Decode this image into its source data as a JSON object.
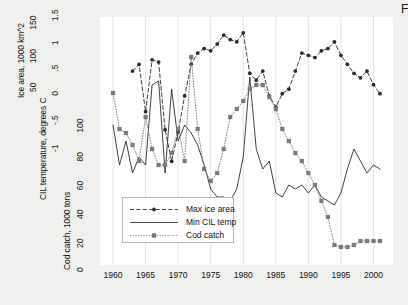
{
  "corner_mark": "F",
  "colors": {
    "page_background": "#f0f0ee",
    "plot_background": "#ffffff",
    "gridline": "#e3e3e3",
    "ice_series": "#2b2b2b",
    "temp_series": "#2b2b2b",
    "cod_series": "#7a7a7a",
    "text": "#111111"
  },
  "axes": {
    "ice": {
      "title": "Ice area, 1000 km^2",
      "ticks": [
        "50",
        "100",
        "150",
        "200"
      ],
      "values": [
        50,
        100,
        150,
        200
      ]
    },
    "cil": {
      "title": "CIL temperature, degrees C",
      "ticks": [
        "-1",
        "-.5",
        "0",
        ".5",
        "1",
        "1.5"
      ],
      "values": [
        -1,
        -0.5,
        0,
        0.5,
        1,
        1.5
      ]
    },
    "cod": {
      "title": "Cod catch, 1000 tons",
      "ticks": [
        "0",
        "20",
        "40",
        "60",
        "80",
        "100"
      ],
      "values": [
        0,
        20,
        40,
        60,
        80,
        100
      ]
    },
    "x": {
      "ticks": [
        "1960",
        "1965",
        "1970",
        "1975",
        "1980",
        "1985",
        "1990",
        "1995",
        "2000"
      ],
      "values": [
        1960,
        1965,
        1970,
        1975,
        1980,
        1985,
        1990,
        1995,
        2000
      ]
    }
  },
  "legend": {
    "items": [
      {
        "label": "Max ice area",
        "style": "dashed-marker",
        "marker": "circle"
      },
      {
        "label": "Min CIL temp",
        "style": "solid",
        "marker": "none"
      },
      {
        "label": "Cod catch",
        "style": "dotted-marker",
        "marker": "square"
      }
    ]
  },
  "chart_data": {
    "type": "line",
    "title": "",
    "xlabel": "",
    "ylabel": "",
    "grid": "vertical",
    "legend_position": "inside-bottom-left",
    "xlim": [
      1958,
      2003
    ],
    "series": [
      {
        "name": "Max ice area",
        "units": "1000 km^2",
        "axis": "ice",
        "ylim": [
          0,
          220
        ],
        "style": "dashed",
        "marker": "circle",
        "x": [
          1963,
          1964,
          1965,
          1966,
          1967,
          1968,
          1969,
          1970,
          1971,
          1972,
          1973,
          1974,
          1975,
          1976,
          1977,
          1978,
          1979,
          1980,
          1981,
          1982,
          1983,
          1984,
          1985,
          1986,
          1987,
          1988,
          1989,
          1990,
          1991,
          1992,
          1993,
          1994,
          1995,
          1996,
          1997,
          1998,
          1999,
          2000,
          2001
        ],
        "y": [
          172,
          178,
          136,
          182,
          180,
          120,
          92,
          118,
          150,
          178,
          188,
          192,
          190,
          196,
          204,
          200,
          198,
          206,
          170,
          164,
          172,
          150,
          140,
          152,
          156,
          172,
          188,
          186,
          184,
          190,
          192,
          198,
          186,
          178,
          170,
          166,
          172,
          160,
          152
        ]
      },
      {
        "name": "Min CIL temp",
        "units": "degrees C",
        "axis": "cil",
        "ylim": [
          -1.3,
          1.8
        ],
        "style": "solid",
        "marker": "none",
        "x": [
          1960,
          1961,
          1962,
          1963,
          1964,
          1965,
          1966,
          1967,
          1968,
          1969,
          1970,
          1971,
          1972,
          1973,
          1974,
          1975,
          1976,
          1977,
          1978,
          1979,
          1980,
          1981,
          1982,
          1983,
          1984,
          1985,
          1986,
          1987,
          1988,
          1989,
          1990,
          1991,
          1992,
          1993,
          1994,
          1995,
          1996,
          1997,
          1998,
          1999,
          2000,
          2001
        ],
        "y": [
          0.45,
          -0.05,
          0.25,
          -0.15,
          0.05,
          -0.05,
          0.95,
          1.0,
          -0.15,
          0.9,
          0.25,
          0.45,
          0.35,
          0.2,
          -0.05,
          -0.35,
          -0.45,
          -0.45,
          -0.5,
          -0.35,
          0.05,
          1.05,
          0.15,
          -0.1,
          0.0,
          -0.4,
          -0.45,
          -0.3,
          -0.35,
          -0.3,
          -0.4,
          -0.3,
          -0.45,
          -0.5,
          -0.55,
          -0.4,
          -0.1,
          0.15,
          0.0,
          -0.15,
          -0.05,
          -0.1
        ]
      },
      {
        "name": "Cod catch",
        "units": "1000 tons",
        "axis": "cod",
        "ylim": [
          -6,
          118
        ],
        "style": "dotted",
        "marker": "square",
        "x": [
          1960,
          1961,
          1962,
          1963,
          1964,
          1965,
          1966,
          1967,
          1968,
          1969,
          1970,
          1971,
          1972,
          1973,
          1974,
          1975,
          1976,
          1977,
          1978,
          1979,
          1980,
          1981,
          1982,
          1983,
          1984,
          1985,
          1986,
          1987,
          1988,
          1989,
          1990,
          1991,
          1992,
          1993,
          1994,
          1995,
          1996,
          1997,
          1998,
          1999,
          2000,
          2001
        ],
        "y": [
          80,
          62,
          60,
          54,
          46,
          68,
          52,
          44,
          44,
          50,
          62,
          46,
          98,
          62,
          42,
          36,
          40,
          52,
          68,
          72,
          76,
          82,
          84,
          84,
          78,
          72,
          62,
          56,
          50,
          46,
          40,
          34,
          26,
          18,
          4,
          3,
          3,
          4,
          6,
          6,
          6,
          6
        ]
      }
    ]
  }
}
